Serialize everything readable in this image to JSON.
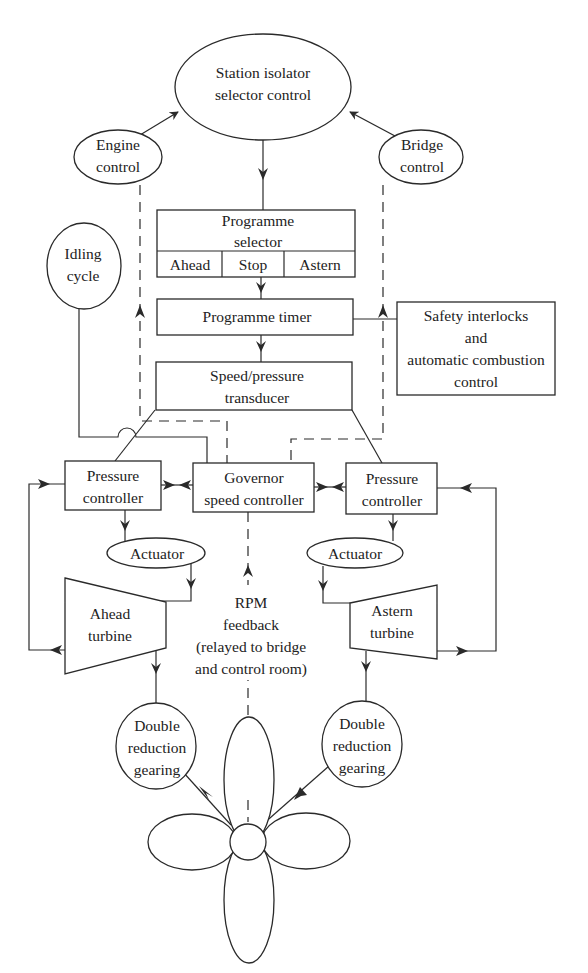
{
  "diagram": {
    "nodes": {
      "station_isolator": {
        "line1": "Station isolator",
        "line2": "selector control"
      },
      "engine_control": {
        "line1": "Engine",
        "line2": "control"
      },
      "bridge_control": {
        "line1": "Bridge",
        "line2": "control"
      },
      "idling_cycle": {
        "line1": "Idling",
        "line2": "cycle"
      },
      "programme_selector": {
        "line1": "Programme",
        "line2": "selector",
        "options": [
          "Ahead",
          "Stop",
          "Astern"
        ]
      },
      "programme_timer": {
        "label": "Programme timer"
      },
      "safety": {
        "line1": "Safety interlocks",
        "line2": "and",
        "line3": "automatic combustion",
        "line4": "control"
      },
      "transducer": {
        "line1": "Speed/pressure",
        "line2": "transducer"
      },
      "pressure_controller_left": {
        "line1": "Pressure",
        "line2": "controller"
      },
      "governor": {
        "line1": "Governor",
        "line2": "speed controller"
      },
      "pressure_controller_right": {
        "line1": "Pressure",
        "line2": "controller"
      },
      "actuator_left": {
        "label": "Actuator"
      },
      "actuator_right": {
        "label": "Actuator"
      },
      "ahead_turbine": {
        "line1": "Ahead",
        "line2": "turbine"
      },
      "astern_turbine": {
        "line1": "Astern",
        "line2": "turbine"
      },
      "rpm_feedback": {
        "line1": "RPM",
        "line2": "feedback",
        "line3": "(relayed to bridge",
        "line4": "and control room)"
      },
      "gearing_left": {
        "line1": "Double",
        "line2": "reduction",
        "line3": "gearing"
      },
      "gearing_right": {
        "line1": "Double",
        "line2": "reduction",
        "line3": "gearing"
      },
      "propeller": {
        "label": "Propeller"
      }
    }
  }
}
